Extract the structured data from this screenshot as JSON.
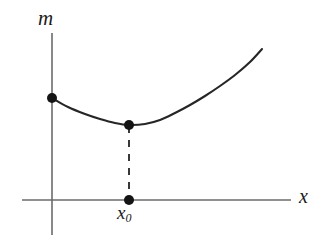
{
  "figure": {
    "background_color": "#ffffff",
    "width": 331,
    "height": 245,
    "axis_color": "#6b6b6b",
    "curve_color": "#262626",
    "dash_color": "#303030",
    "dot_color": "#141414",
    "labels": {
      "y_axis": "m",
      "x_axis": "x",
      "minimum_x_base": "x",
      "minimum_x_subscript": "0"
    }
  },
  "chart_data": {
    "type": "line",
    "title": "",
    "subtitle": "",
    "xlabel": "x",
    "ylabel": "m",
    "grid": false,
    "legend": null,
    "annotations": [
      {
        "name": "minimum-label",
        "text": "x₀",
        "x": 129,
        "y": 213,
        "description": "tick label marking abscissa of the curve minimum"
      }
    ],
    "axes": {
      "x_axis": {
        "pixel_y": 200,
        "pixel_x_start": 22,
        "pixel_x_end": 291,
        "label": "x",
        "ticks": [],
        "tick_labels": []
      },
      "y_axis": {
        "pixel_x": 52,
        "pixel_y_top": 33,
        "pixel_y_bottom": 235,
        "label": "m",
        "ticks": [],
        "tick_labels": []
      }
    },
    "series": [
      {
        "name": "m(x)",
        "description": "convex curve with a single interior minimum at x0",
        "points": [
          {
            "x": 52,
            "y": 98
          },
          {
            "x": 68,
            "y": 107
          },
          {
            "x": 85,
            "y": 114
          },
          {
            "x": 100,
            "y": 119
          },
          {
            "x": 115,
            "y": 123
          },
          {
            "x": 129,
            "y": 125
          },
          {
            "x": 145,
            "y": 124
          },
          {
            "x": 160,
            "y": 120
          },
          {
            "x": 175,
            "y": 113
          },
          {
            "x": 190,
            "y": 105
          },
          {
            "x": 205,
            "y": 96
          },
          {
            "x": 220,
            "y": 86
          },
          {
            "x": 235,
            "y": 75
          },
          {
            "x": 250,
            "y": 62
          },
          {
            "x": 262,
            "y": 49
          }
        ]
      }
    ],
    "markers": [
      {
        "name": "curve-y-intercept-dot",
        "x": 52,
        "y": 98,
        "radius": 5
      },
      {
        "name": "curve-minimum-dot",
        "x": 129,
        "y": 125,
        "radius": 5
      },
      {
        "name": "x-axis-foot-dot",
        "x": 129,
        "y": 200,
        "radius": 5
      }
    ],
    "drop_line": {
      "name": "minimum-drop-line",
      "from": {
        "x": 129,
        "y": 125
      },
      "to": {
        "x": 129,
        "y": 200
      },
      "style": "dashed"
    }
  }
}
